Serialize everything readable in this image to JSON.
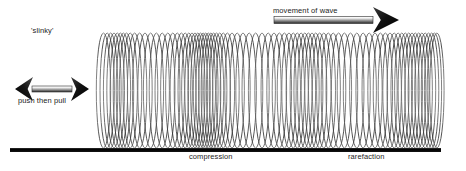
{
  "figure": {
    "background_color": "#ffffff"
  },
  "labels": {
    "slinky": "'slinky'",
    "push_then_pull": "push then pull",
    "movement_of_wave": "movement of wave",
    "compression": "compression",
    "rarefaction": "rarefaction"
  },
  "colors": {
    "coil_stroke": "#3a3a3a",
    "baseline": "#000000",
    "text": "#232323",
    "arrow_dark": "#1a1a1a",
    "arrow_light": "#f2f2f2",
    "arrow_mid": "#8a8a8a"
  },
  "baseline": {
    "x1": 10,
    "x2": 441,
    "y": 150,
    "thickness": 4
  },
  "movement_arrow": {
    "direction": "right",
    "x1": 274,
    "x2": 399,
    "y": 20,
    "shaft_height": 7,
    "head_length": 26,
    "head_half_height": 13
  },
  "push_pull_arrow": {
    "direction": "both",
    "x1": 15,
    "x2": 89,
    "y": 89,
    "shaft_height": 6,
    "head_length": 18,
    "head_half_height": 12
  },
  "chart_data": {
    "type": "line",
    "xlabel": "",
    "ylabel": "",
    "coil_top_y": 33,
    "coil_bottom_y": 148,
    "coil_rx": 7.2,
    "coil_ry": 57.5,
    "coil_centers_x": [
      103.5,
      107.2,
      110.6,
      114.0,
      117.3,
      120.4,
      123.4,
      126.5,
      130.2,
      134.6,
      139.6,
      145.0,
      150.6,
      156.4,
      162.2,
      167.8,
      172.8,
      177.3,
      181.4,
      185.2,
      188.8,
      192.0,
      195.0,
      197.8,
      200.5,
      203.1,
      205.7,
      208.3,
      210.9,
      213.6,
      216.5,
      219.7,
      223.3,
      227.4,
      232.0,
      237.2,
      243.0,
      249.2,
      255.6,
      262.0,
      268.2,
      274.0,
      279.4,
      284.4,
      289.0,
      293.3,
      297.3,
      301.1,
      304.8,
      308.4,
      312.0,
      315.7,
      319.6,
      323.8,
      328.3,
      333.2,
      338.6,
      344.4,
      350.5,
      356.8,
      363.1,
      369.2,
      375.0,
      380.4,
      385.4,
      390.0,
      394.2,
      398.1,
      401.8,
      405.3,
      408.7,
      412.0,
      415.3,
      418.6,
      421.9,
      425.2,
      428.5,
      431.6,
      434.4,
      436.9
    ],
    "regions": [
      {
        "name": "compression",
        "label": "compression",
        "center_x": 213,
        "x_start": 186,
        "x_end": 236
      },
      {
        "name": "rarefaction",
        "label": "rarefaction",
        "center_x": 366,
        "x_start": 330,
        "x_end": 400
      }
    ]
  }
}
